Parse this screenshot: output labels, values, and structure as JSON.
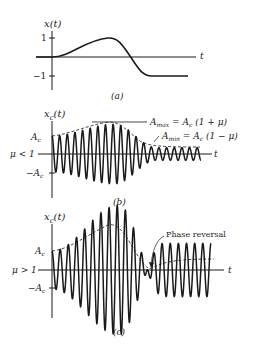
{
  "panels": [
    {
      "id": "a",
      "caption": "(a)",
      "ylabel": "x(t)",
      "xlabel": "t",
      "ticks": {
        "pos": "1",
        "neg": "−1"
      }
    },
    {
      "id": "b",
      "caption": "(b)",
      "ylabel": "x",
      "ylabel_sub": "c",
      "ylabel_arg": "(t)",
      "xlabel": "t",
      "condition": "μ < 1",
      "ticks": {
        "pos": "A",
        "pos_sub": "c",
        "neg": "−A",
        "neg_sub": "c"
      },
      "annotations": {
        "amax": {
          "A": "A",
          "sub": "max",
          "rhs": " = A",
          "rhs_sub": "c",
          "tail": " (1 + μ)"
        },
        "amin": {
          "A": "A",
          "sub": "min",
          "rhs": " = A",
          "rhs_sub": "c",
          "tail": " (1 − μ)"
        }
      }
    },
    {
      "id": "c",
      "caption": "(c)",
      "ylabel": "x",
      "ylabel_sub": "c",
      "ylabel_arg": "(t)",
      "xlabel": "t",
      "condition": "μ > 1",
      "ticks": {
        "pos": "A",
        "pos_sub": "c",
        "neg": "−A",
        "neg_sub": "c"
      },
      "annotations": {
        "phase": "Phase reversal"
      }
    }
  ],
  "colors": {
    "ink": "#1a1a1a",
    "background": "#ffffff"
  }
}
